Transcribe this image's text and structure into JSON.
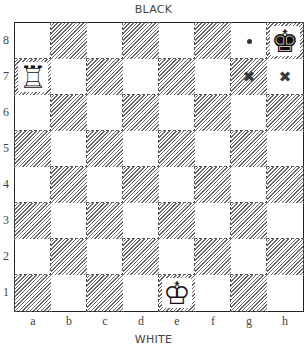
{
  "title_top": "BLACK",
  "title_bottom": "WHITE",
  "ranks": [
    "8",
    "7",
    "6",
    "5",
    "4",
    "3",
    "2",
    "1"
  ],
  "files": [
    "a",
    "b",
    "c",
    "d",
    "e",
    "f",
    "g",
    "h"
  ],
  "colors": {
    "border": "#222222",
    "hatch": "#6b6b6b",
    "light": "#ffffff"
  },
  "pieces": [
    {
      "square": "h8",
      "piece": "king",
      "color": "black",
      "glyph": "♚"
    },
    {
      "square": "a7",
      "piece": "rook",
      "color": "white",
      "glyph": "♖"
    },
    {
      "square": "e1",
      "piece": "king",
      "color": "white",
      "glyph": "♔"
    }
  ],
  "markers": [
    {
      "square": "g8",
      "type": "dot",
      "glyph": "•"
    },
    {
      "square": "g7",
      "type": "cross",
      "glyph": "✖"
    },
    {
      "square": "h7",
      "type": "cross",
      "glyph": "✖"
    }
  ]
}
